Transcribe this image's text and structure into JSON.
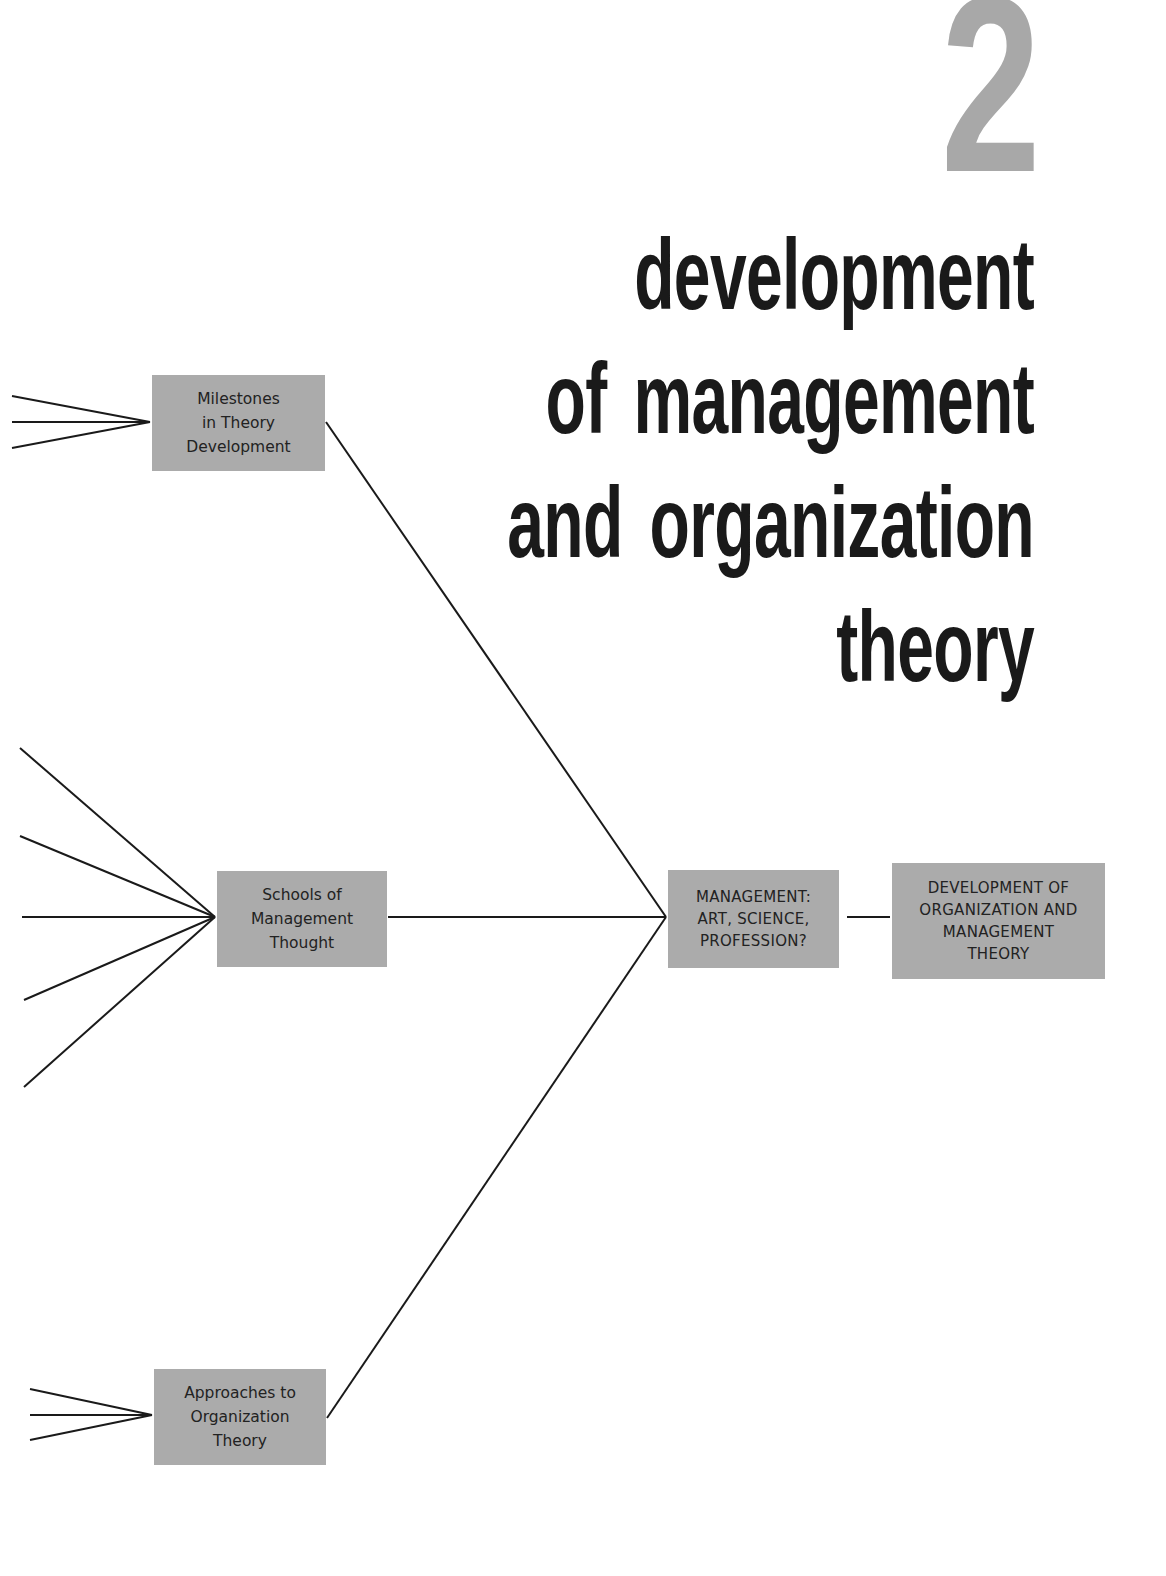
{
  "chapter": {
    "number": "2",
    "title_lines": [
      "development",
      "of management",
      "and organization",
      "theory"
    ],
    "number_color": "#a8a8a8",
    "title_color": "#1a1a1a"
  },
  "diagram": {
    "box_color": "#ababab",
    "line_color": "#1a1a1a",
    "nodes": {
      "milestones": {
        "label": "Milestones\nin Theory\nDevelopment",
        "incoming_branches": 3
      },
      "schools": {
        "label": "Schools of\nManagement\nThought",
        "incoming_branches": 5
      },
      "approaches": {
        "label": "Approaches to\nOrganization\nTheory",
        "incoming_branches": 3
      },
      "management": {
        "label": "MANAGEMENT:\nART, SCIENCE,\nPROFESSION?"
      },
      "development": {
        "label": "DEVELOPMENT OF\nORGANIZATION AND\nMANAGEMENT\nTHEORY"
      }
    },
    "edges": [
      {
        "from": "milestones",
        "to": "management"
      },
      {
        "from": "schools",
        "to": "management"
      },
      {
        "from": "approaches",
        "to": "management"
      },
      {
        "from": "management",
        "to": "development"
      }
    ]
  }
}
